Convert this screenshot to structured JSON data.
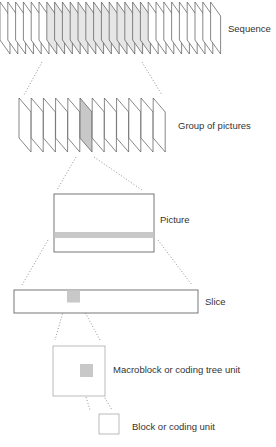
{
  "levels": [
    {
      "id": "sequence",
      "label": "Sequence",
      "frame_count": 28,
      "highlighted_range": [
        6,
        18
      ]
    },
    {
      "id": "gop",
      "label": "Group of pictures",
      "frame_count": 12,
      "highlighted_index": 5
    },
    {
      "id": "picture",
      "label": "Picture"
    },
    {
      "id": "slice",
      "label": "Slice"
    },
    {
      "id": "macroblock",
      "label": "Macroblock or coding tree unit"
    },
    {
      "id": "block",
      "label": "Block or coding unit"
    }
  ],
  "colors": {
    "stroke": "#555555",
    "light_stroke": "#aaaaaa",
    "highlight": "#c8c8c8",
    "highlight_light": "#e6e6e6",
    "connector": "#777777"
  }
}
